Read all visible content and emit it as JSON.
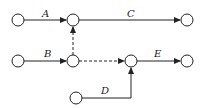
{
  "diagram": {
    "type": "activity-on-arrow network",
    "nodes": [
      {
        "id": "n1",
        "x": 18,
        "y": 20
      },
      {
        "id": "n2",
        "x": 73,
        "y": 20
      },
      {
        "id": "n3",
        "x": 187,
        "y": 20
      },
      {
        "id": "n4",
        "x": 18,
        "y": 61
      },
      {
        "id": "n5",
        "x": 73,
        "y": 61
      },
      {
        "id": "n6",
        "x": 131,
        "y": 61
      },
      {
        "id": "n7",
        "x": 187,
        "y": 61
      },
      {
        "id": "n8",
        "x": 76,
        "y": 98
      }
    ],
    "activities": [
      {
        "label": "A",
        "from": "n1",
        "to": "n2"
      },
      {
        "label": "C",
        "from": "n2",
        "to": "n3"
      },
      {
        "label": "B",
        "from": "n4",
        "to": "n5"
      },
      {
        "label": "E",
        "from": "n6",
        "to": "n7"
      },
      {
        "label": "D",
        "from": "n8",
        "to": "n6"
      }
    ],
    "dummies": [
      {
        "from": "n5",
        "to": "n2"
      },
      {
        "from": "n5",
        "to": "n6"
      }
    ],
    "labels": {
      "a": "A",
      "b": "B",
      "c": "C",
      "d": "D",
      "e": "E"
    }
  }
}
